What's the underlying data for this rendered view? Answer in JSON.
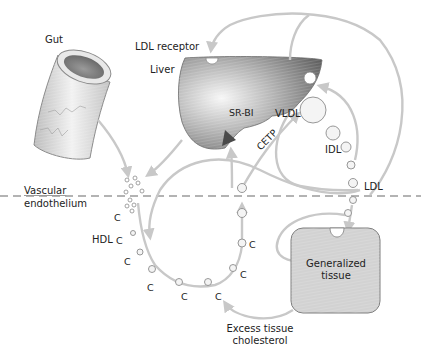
{
  "diagram": {
    "colors": {
      "arrow": "#c8c8c8",
      "liver_dark": "#6e6e6e",
      "liver_light": "#f4f4f4",
      "tissue_fill": "#d4d4d4",
      "tissue_stroke": "#8a8a8a",
      "particle_fill": "#f0f0f0",
      "particle_stroke": "#8c8c8c",
      "dashed_line": "#9a9a9a",
      "text": "#222222"
    },
    "labels": {
      "gut": "Gut",
      "ldl_receptor": "LDL receptor",
      "liver": "Liver",
      "sr_bi": "SR-BI",
      "vldl": "VLDL",
      "cetp": "CETP",
      "idl": "IDL",
      "ldl": "LDL",
      "vascular_line1": "Vascular",
      "vascular_line2": "endothelium",
      "hdl": "HDL",
      "generalized_line1": "Generalized",
      "generalized_line2": "tissue",
      "excess_line1": "Excess tissue",
      "excess_line2": "cholesterol"
    },
    "cholesterol_marker": "C",
    "nodes": [
      {
        "id": "gut",
        "label": "Gut",
        "type": "organ"
      },
      {
        "id": "liver",
        "label": "Liver",
        "type": "organ"
      },
      {
        "id": "tissue",
        "label": "Generalized tissue",
        "type": "organ"
      },
      {
        "id": "vldl",
        "label": "VLDL",
        "type": "lipoprotein"
      },
      {
        "id": "idl",
        "label": "IDL",
        "type": "lipoprotein"
      },
      {
        "id": "ldl",
        "label": "LDL",
        "type": "lipoprotein"
      },
      {
        "id": "hdl",
        "label": "HDL",
        "type": "lipoprotein"
      }
    ],
    "edges": [
      {
        "from": "gut",
        "to": "vascular"
      },
      {
        "from": "liver",
        "to": "vascular"
      },
      {
        "from": "liver",
        "to": "vldl"
      },
      {
        "from": "vldl",
        "to": "idl"
      },
      {
        "from": "idl",
        "to": "ldl"
      },
      {
        "from": "ldl",
        "to": "tissue"
      },
      {
        "from": "ldl",
        "to": "liver",
        "via": "LDL receptor"
      },
      {
        "from": "idl",
        "to": "liver"
      },
      {
        "from": "tissue",
        "to": "hdl",
        "label": "Excess tissue cholesterol"
      },
      {
        "from": "hdl",
        "to": "liver",
        "via": "SR-BI"
      },
      {
        "from": "hdl",
        "to": "vldl",
        "label": "CETP"
      }
    ]
  }
}
